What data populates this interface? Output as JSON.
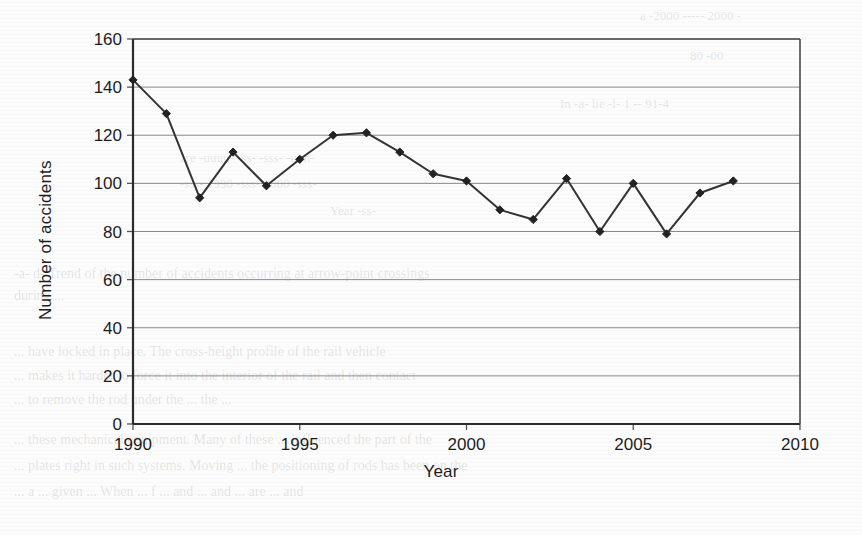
{
  "figure": {
    "y_axis_title": "Number of accidents",
    "x_axis_title": "Year"
  },
  "chart_data": {
    "type": "line",
    "title": "",
    "subtitle": "",
    "xlabel": "Year",
    "ylabel": "Number of accidents",
    "xlim": [
      1990,
      2010
    ],
    "ylim": [
      0,
      160
    ],
    "xticks": [
      1990,
      1995,
      2000,
      2005,
      2010
    ],
    "yticks": [
      0,
      20,
      40,
      60,
      80,
      100,
      120,
      140,
      160
    ],
    "xtick_labels": [
      "1990",
      "1995",
      "2000",
      "2005",
      "2010"
    ],
    "ytick_labels": [
      "0",
      "20",
      "40",
      "60",
      "80",
      "100",
      "120",
      "140",
      "160"
    ],
    "grid": "horizontal",
    "legend": "none",
    "marker": "diamond",
    "line_color": "#333333",
    "marker_color": "#222222",
    "x": [
      1990,
      1991,
      1992,
      1993,
      1994,
      1995,
      1996,
      1997,
      1998,
      1999,
      2000,
      2001,
      2002,
      2003,
      2004,
      2005,
      2006,
      2007,
      2008
    ],
    "values": [
      143,
      129,
      94,
      113,
      99,
      110,
      120,
      121,
      113,
      104,
      101,
      89,
      85,
      102,
      80,
      100,
      79,
      96,
      101
    ],
    "series": [
      {
        "name": "Number of accidents",
        "values": [
          143,
          129,
          94,
          113,
          99,
          110,
          120,
          121,
          113,
          104,
          101,
          89,
          85,
          102,
          80,
          100,
          79,
          96,
          101
        ]
      }
    ]
  },
  "background_text": {
    "top_right_a": "a -2000 ----- 2000 -",
    "top_right_b": "80 -00",
    "row_b": "In -a- lie -l- 1 -- 91-4",
    "row_c": "are -uuuu-     -ss-     -sss-    -uun-",
    "row_d": "-sss-    1990    -sss-     2000    -sss-",
    "row_e": "Year -ss-",
    "caption": "-a- d- Trend of the number of accidents occurring at arrow-point crossings",
    "caption2": "during ...",
    "para1": "... have locked in place. The cross-height profile of the rail vehicle",
    "para2": "... makes it harder to force it into the interior of the rail and then contact",
    "para3": "... to remove the rod under the ... the ...",
    "para4": "... these mechanical equipment. Many of these ... influenced the part of the",
    "para5": "... plates right in such systems. Moving ... the positioning of rods has been on the",
    "para6": "... a ... given ... When ... f ... and ... and ... are ... and"
  }
}
